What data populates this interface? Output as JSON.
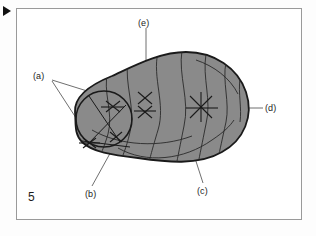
{
  "figure": {
    "number": "5",
    "kind": "schematic-diagram"
  },
  "marker": {
    "play_icon": "play-triangle-icon"
  },
  "colors": {
    "page_background": "#fdfdfd",
    "frame_border": "#9a9a9a",
    "blob_fill": "#8a8a8a",
    "blob_outline": "#1a1a1a",
    "contour_line": "#2a2a2a",
    "leader_line": "#4a4a4a",
    "text": "#1c1c1c",
    "marker": "#121212"
  },
  "callouts": [
    {
      "id": "a",
      "label": "(a)",
      "x": 33,
      "y": 72,
      "leader_count": 2
    },
    {
      "id": "b",
      "label": "(b)",
      "x": 85,
      "y": 190,
      "leader_count": 1
    },
    {
      "id": "c",
      "label": "(c)",
      "x": 197,
      "y": 187,
      "leader_count": 1
    },
    {
      "id": "d",
      "label": "(d)",
      "x": 265,
      "y": 104,
      "leader_count": 1
    },
    {
      "id": "e",
      "label": "(e)",
      "x": 138,
      "y": 19,
      "leader_count": 1
    }
  ],
  "markers": {
    "cross_count": 6,
    "description": "X-shaped cross markers placed inside the blob region"
  }
}
